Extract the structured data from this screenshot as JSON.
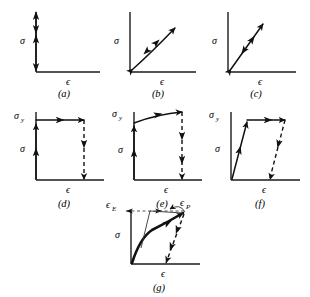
{
  "figure": {
    "background_color": "#ffffff",
    "ink_color": "#111111",
    "axis_color": "#1a1a1a",
    "panels": [
      {
        "id": "a",
        "caption": "(a)",
        "y_axis_label": "σ",
        "x_axis_label": "ϵ",
        "description": "rigid response: vertical double-arrow stack on stress axis, no strain"
      },
      {
        "id": "b",
        "caption": "(b)",
        "y_axis_label": "σ",
        "x_axis_label": "ϵ",
        "description": "nonlinear elastic: concave curve from origin, reversible double arrows"
      },
      {
        "id": "c",
        "caption": "(c)",
        "y_axis_label": "σ",
        "x_axis_label": "ϵ",
        "description": "linear elastic: straight line from origin, reversible double arrows"
      },
      {
        "id": "d",
        "caption": "(d)",
        "y_axis_label": "σ",
        "y_yield_label": "σ",
        "y_yield_sub": "y",
        "x_axis_label": "ϵ",
        "description": "rigid perfectly plastic: vertical rise to yield, flat plateau, dashed vertical unload"
      },
      {
        "id": "e",
        "caption": "(e)",
        "y_axis_label": "σ",
        "y_yield_label": "σ",
        "y_yield_sub": "y",
        "x_axis_label": "ϵ",
        "description": "rigid plastic with hardening: vertical rise to yield, rising curve, dashed vertical unload"
      },
      {
        "id": "f",
        "caption": "(f)",
        "y_axis_label": "σ",
        "y_yield_label": "σ",
        "y_yield_sub": "y",
        "x_axis_label": "ϵ",
        "description": "elastic perfectly plastic: sloped elastic line to yield, flat plateau, dashed parallel elastic unload"
      },
      {
        "id": "g",
        "caption": "(g)",
        "y_axis_label": "σ",
        "x_axis_label": "ϵ",
        "strain_elastic_label": "ϵ",
        "strain_elastic_sub": "E",
        "strain_plastic_label": "ϵ",
        "strain_plastic_sub": "P",
        "description": "elastic plastic with hardening: curved loading, elastic springback splits total strain into plastic and elastic parts"
      }
    ]
  }
}
